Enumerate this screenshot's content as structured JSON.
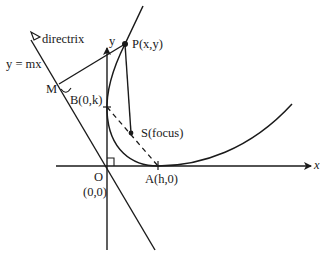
{
  "diagram": {
    "type": "parabola-geometry",
    "labels": {
      "directrix": "directrix",
      "directrix_eq": "y = mx",
      "y_axis": "y",
      "x_axis": "x",
      "point_p": "P(x,y)",
      "point_m": "M",
      "point_b": "B(0,k)",
      "focus": "S(focus)",
      "origin": "O",
      "origin_coords": "(0,0)",
      "vertex_a": "A(h,0)"
    },
    "colors": {
      "stroke": "#1a1a1a",
      "background": "#ffffff"
    }
  }
}
